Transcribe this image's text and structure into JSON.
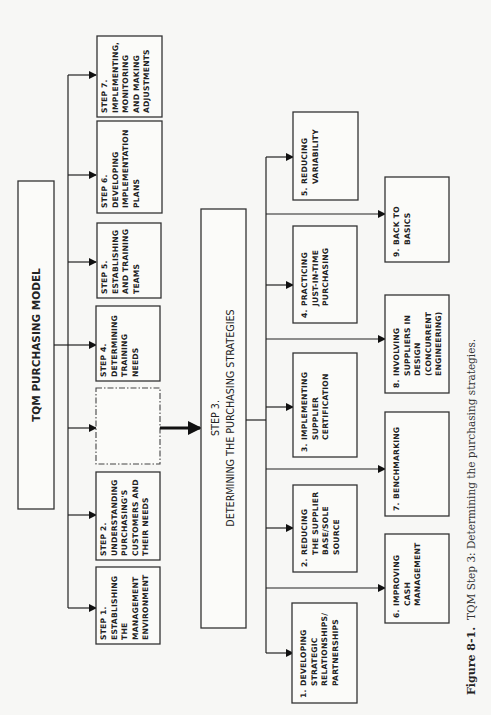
{
  "diagram": {
    "title": "TQM PURCHASING MODEL",
    "steps": [
      {
        "id": "step1",
        "lines": [
          "STEP 1.",
          "ESTABLISHING",
          "THE",
          "MANAGEMENT",
          "ENVIRONMENT"
        ]
      },
      {
        "id": "step2",
        "lines": [
          "STEP 2.",
          "UNDERSTANDING",
          "PURCHASING'S",
          "CUSTOMERS AND",
          "THEIR NEEDS"
        ]
      },
      {
        "id": "placeholder",
        "lines": []
      },
      {
        "id": "step4",
        "lines": [
          "STEP 4.",
          "DETERMINING",
          "TRAINING",
          "NEEDS"
        ]
      },
      {
        "id": "step5",
        "lines": [
          "STEP 5.",
          "ESTABLISHING",
          "AND TRAINING",
          "TEAMS"
        ]
      },
      {
        "id": "step6",
        "lines": [
          "STEP 6.",
          "DEVELOPING",
          "IMPLEMENTATION",
          "PLANS"
        ]
      },
      {
        "id": "step7",
        "lines": [
          "STEP 7.",
          "IMPLEMENTING,",
          "MONITORING",
          "AND MAKING",
          "ADJUSTMENTS"
        ]
      }
    ],
    "step3": {
      "line1": "STEP 3.",
      "line2": "DETERMINING THE PURCHASING STRATEGIES"
    },
    "strategies": [
      {
        "num": "1.",
        "lines": [
          "DEVELOPING",
          "STRATEGIC",
          "RELATIONSHIPS/",
          "PARTNERSHIPS"
        ]
      },
      {
        "num": "2.",
        "lines": [
          "REDUCING",
          "THE SUPPLIER",
          "BASE/SOLE",
          "SOURCE"
        ]
      },
      {
        "num": "3.",
        "lines": [
          "IMPLEMENTING",
          "SUPPLIER",
          "CERTIFICATION"
        ]
      },
      {
        "num": "4.",
        "lines": [
          "PRACTICING",
          "JUST-IN-TIME",
          "PURCHASING"
        ]
      },
      {
        "num": "5.",
        "lines": [
          "REDUCING",
          "VARIABILITY"
        ]
      },
      {
        "num": "6.",
        "lines": [
          "IMPROVING",
          "CASH",
          "MANAGEMENT"
        ]
      },
      {
        "num": "7.",
        "lines": [
          "BENCHMARKING"
        ]
      },
      {
        "num": "8.",
        "lines": [
          "INVOLVING",
          "SUPPLIERS IN",
          "DESIGN",
          "(CONCURRENT",
          "ENGINEERING)"
        ]
      },
      {
        "num": "9.",
        "lines": [
          "BACK TO",
          "BASICS"
        ]
      }
    ]
  },
  "caption": {
    "label": "Figure 8-1.",
    "text": "TQM Step 3: Determining the purchasing strategies."
  }
}
